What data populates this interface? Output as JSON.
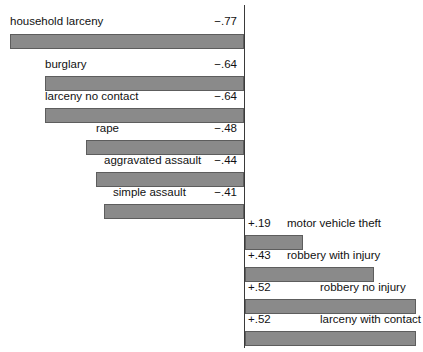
{
  "chart_data": {
    "type": "bar",
    "orientation": "horizontal",
    "title": "",
    "subtitle": "",
    "xlabel": "",
    "ylabel": "",
    "grid": false,
    "legend": false,
    "axis_baseline": 0,
    "categories": [
      "household larceny",
      "burglary",
      "larceny no contact",
      "rape",
      "aggravated assault",
      "simple assault",
      "motor vehicle theft",
      "robbery with injury",
      "robbery no injury",
      "larceny with contact"
    ],
    "values": [
      -0.77,
      -0.64,
      -0.64,
      -0.48,
      -0.44,
      -0.41,
      0.19,
      0.43,
      0.52,
      0.52
    ],
    "value_labels": [
      "−.77",
      "−.64",
      "−.64",
      "−.48",
      "−.44",
      "−.41",
      "+.19",
      "+.43",
      "+.52",
      "+.52"
    ],
    "xlim": [
      -0.85,
      0.58
    ],
    "bar_color": "#8a8a8a",
    "bar_border_color": "#5d5d5d",
    "axis_color": "#3a3a3a"
  },
  "rows": [
    {
      "label": "household larceny",
      "value_label": "−.77",
      "value": -0.77,
      "side": "negative",
      "label_left": 10,
      "text_top": 14,
      "bar_left": 10,
      "bar_right": 244,
      "bar_top": 34
    },
    {
      "label": "burglary",
      "value_label": "−.64",
      "value": -0.64,
      "side": "negative",
      "label_left": 45,
      "text_top": 57,
      "bar_left": 45,
      "bar_right": 244,
      "bar_top": 76
    },
    {
      "label": "larceny no contact",
      "value_label": "−.64",
      "value": -0.64,
      "side": "negative",
      "label_left": 45,
      "text_top": 89,
      "bar_left": 45,
      "bar_right": 244,
      "bar_top": 108
    },
    {
      "label": "rape",
      "value_label": "−.48",
      "value": -0.48,
      "side": "negative",
      "label_left": 96,
      "text_top": 121,
      "bar_left": 86,
      "bar_right": 244,
      "bar_top": 140
    },
    {
      "label": "aggravated assault",
      "value_label": "−.44",
      "value": -0.44,
      "side": "negative",
      "label_left": 104,
      "text_top": 153,
      "bar_left": 96,
      "bar_right": 244,
      "bar_top": 172
    },
    {
      "label": "simple assault",
      "value_label": "−.41",
      "value": -0.41,
      "side": "negative",
      "label_left": 113,
      "text_top": 185,
      "bar_left": 104,
      "bar_right": 244,
      "bar_top": 204
    },
    {
      "label": "motor vehicle theft",
      "value_label": "+.19",
      "value": 0.19,
      "side": "positive",
      "label_left": 287,
      "text_top": 216,
      "bar_left": 245,
      "bar_right": 303,
      "bar_top": 235
    },
    {
      "label": "robbery with injury",
      "value_label": "+.43",
      "value": 0.43,
      "side": "positive",
      "label_left": 287,
      "text_top": 248,
      "bar_left": 245,
      "bar_right": 374,
      "bar_top": 267
    },
    {
      "label": "robbery no injury",
      "value_label": "+.52",
      "value": 0.52,
      "side": "positive",
      "label_left": 320,
      "text_top": 280,
      "bar_left": 245,
      "bar_right": 416,
      "bar_top": 299
    },
    {
      "label": "larceny with contact",
      "value_label": "+.52",
      "value": 0.52,
      "side": "positive",
      "label_left": 320,
      "text_top": 312,
      "bar_left": 245,
      "bar_right": 416,
      "bar_top": 331
    }
  ],
  "axis": {
    "x": 244,
    "top": 5,
    "bottom": 348
  }
}
